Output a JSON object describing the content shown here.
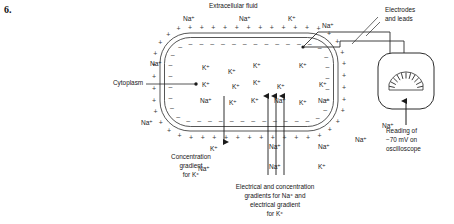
{
  "question_number": "6.",
  "labels": {
    "extracellular_fluid": "Extracellular fluid",
    "cytoplasm": "Cytoplasm",
    "electrodes": "Electrodes",
    "electrodes_2": "and leads",
    "reading_1": "Reading of",
    "reading_2": "−70 mV on",
    "reading_3": "oscilloscope",
    "conc_grad_1": "Concentration",
    "conc_grad_2": "gradient",
    "conc_grad_3": "for K⁺",
    "elec_conc_1": "Electrical and concentration",
    "elec_conc_2": "gradients for Na⁺ and",
    "elec_conc_3": "electrical gradient",
    "elec_conc_4": "for K⁺"
  },
  "ions": {
    "outside": [
      {
        "text": "Na⁺",
        "x": 183,
        "y": 15
      },
      {
        "text": "Na⁺",
        "x": 239,
        "y": 15
      },
      {
        "text": "K⁺",
        "x": 288,
        "y": 15
      },
      {
        "text": "Na⁺",
        "x": 322,
        "y": 22
      },
      {
        "text": "Na⁺",
        "x": 150,
        "y": 60
      },
      {
        "text": "Na⁺",
        "x": 141,
        "y": 119
      },
      {
        "text": "K⁺",
        "x": 210,
        "y": 145
      },
      {
        "text": "Na⁺",
        "x": 198,
        "y": 165
      },
      {
        "text": "Na⁺",
        "x": 269,
        "y": 143
      },
      {
        "text": "Na⁺",
        "x": 269,
        "y": 163
      },
      {
        "text": "Na⁺",
        "x": 318,
        "y": 143
      },
      {
        "text": "K⁺",
        "x": 318,
        "y": 163
      },
      {
        "text": "Na⁺",
        "x": 355,
        "y": 136
      },
      {
        "text": "Na⁺",
        "x": 382,
        "y": 122
      }
    ],
    "inside": [
      {
        "text": "K⁺",
        "x": 202,
        "y": 64
      },
      {
        "text": "K⁺",
        "x": 228,
        "y": 68
      },
      {
        "text": "K⁺",
        "x": 253,
        "y": 62
      },
      {
        "text": "K⁺",
        "x": 299,
        "y": 62
      },
      {
        "text": "K⁺",
        "x": 202,
        "y": 81
      },
      {
        "text": "K⁺",
        "x": 232,
        "y": 83
      },
      {
        "text": "K⁺",
        "x": 253,
        "y": 79
      },
      {
        "text": "K⁺",
        "x": 277,
        "y": 83
      },
      {
        "text": "K⁺",
        "x": 319,
        "y": 81
      },
      {
        "text": "Na⁺",
        "x": 200,
        "y": 97
      },
      {
        "text": "K⁺",
        "x": 229,
        "y": 99
      },
      {
        "text": "K⁺",
        "x": 251,
        "y": 97
      },
      {
        "text": "Na⁺",
        "x": 274,
        "y": 97
      },
      {
        "text": "K⁺",
        "x": 299,
        "y": 99
      },
      {
        "text": "Na⁺",
        "x": 318,
        "y": 97
      }
    ]
  },
  "meter": {
    "tick_count": 11,
    "needle": "pointer-arrow"
  },
  "colors": {
    "ink": "#1a1a1a",
    "line": "#2b2b2b",
    "sign": "#3a3a3a",
    "background": "#ffffff"
  }
}
